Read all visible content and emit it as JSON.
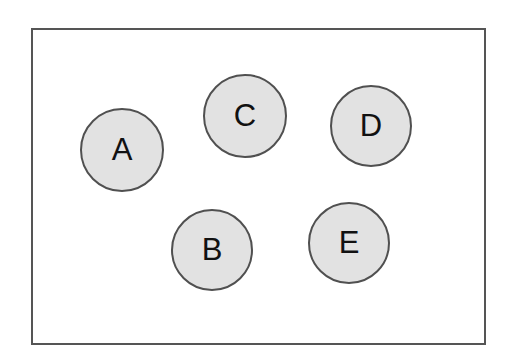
{
  "diagram": {
    "frame": {
      "left": 31,
      "top": 28,
      "width": 455,
      "height": 317
    },
    "nodes": [
      {
        "label": "A",
        "cx": 122,
        "cy": 150,
        "r": 42
      },
      {
        "label": "B",
        "cx": 212,
        "cy": 250,
        "r": 41
      },
      {
        "label": "C",
        "cx": 245,
        "cy": 116,
        "r": 42
      },
      {
        "label": "D",
        "cx": 371,
        "cy": 126,
        "r": 41
      },
      {
        "label": "E",
        "cx": 349,
        "cy": 243,
        "r": 41
      }
    ],
    "colors": {
      "fill": "#e2e2e2",
      "stroke": "#505050",
      "frame": "#555555"
    }
  }
}
